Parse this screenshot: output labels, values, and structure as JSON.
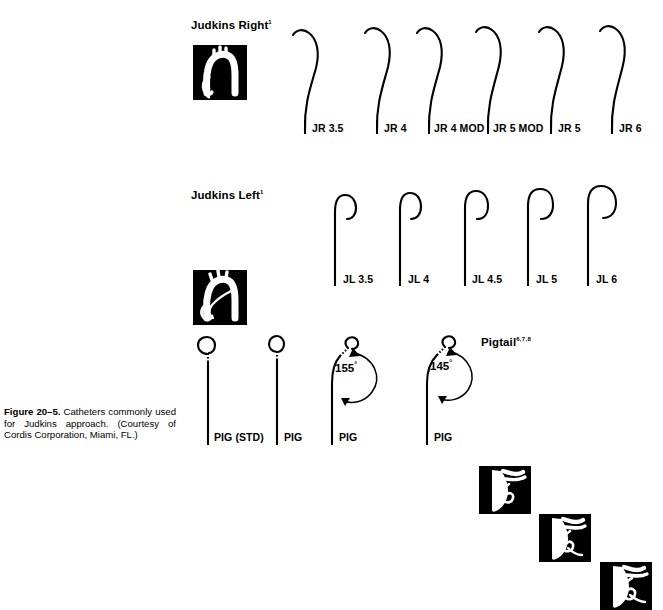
{
  "figure": {
    "number_label": "Figure 20–5.",
    "caption_text": " Catheters commonly used for Judkins approach. (Courtesy of Cordis Corporation, Miami, FL.)"
  },
  "sections": [
    {
      "id": "judkins-right",
      "title": "Judkins Right",
      "superscript": "1",
      "thumbnail_icon": "aortic-arch-right-coronary-icon",
      "catheters": [
        {
          "label": "JR 3.5"
        },
        {
          "label": "JR 4"
        },
        {
          "label": "JR 4 MOD"
        },
        {
          "label": "JR 5 MOD"
        },
        {
          "label": "JR 5"
        },
        {
          "label": "JR 6"
        }
      ]
    },
    {
      "id": "judkins-left",
      "title": "Judkins Left",
      "superscript": "1",
      "thumbnail_icon": "aortic-arch-left-coronary-icon",
      "catheters": [
        {
          "label": "JL 3.5"
        },
        {
          "label": "JL 4"
        },
        {
          "label": "JL 4.5"
        },
        {
          "label": "JL 5"
        },
        {
          "label": "JL 6"
        }
      ]
    },
    {
      "id": "pigtail",
      "title": "Pigtail",
      "superscript": "6,7,8",
      "thumbnail_icons": [
        "ventriculogram-icon-1",
        "ventriculogram-icon-2",
        "ventriculogram-icon-3"
      ],
      "catheters": [
        {
          "label": "PIG (STD)",
          "angle": ""
        },
        {
          "label": "PIG",
          "angle": ""
        },
        {
          "label": "PIG",
          "angle": "155",
          "angle_unit": "°"
        },
        {
          "label": "PIG",
          "angle": "145",
          "angle_unit": "°"
        }
      ]
    }
  ],
  "colors": {
    "ink": "#000000",
    "paper": "#ffffff",
    "thumbnail_background": "#000000",
    "thumbnail_art": "#ffffff"
  }
}
